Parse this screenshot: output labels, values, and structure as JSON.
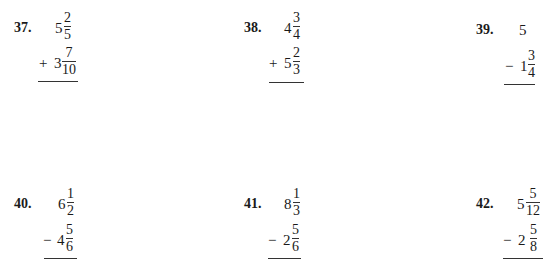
{
  "problems": [
    {
      "number": "37.",
      "top": {
        "whole": "5",
        "num": "2",
        "den": "5"
      },
      "operator": "+",
      "bottom": {
        "whole": "3",
        "num": "7",
        "den": "10"
      }
    },
    {
      "number": "38.",
      "top": {
        "whole": "4",
        "num": "3",
        "den": "4"
      },
      "operator": "+",
      "bottom": {
        "whole": "5",
        "num": "2",
        "den": "3"
      }
    },
    {
      "number": "39.",
      "top": {
        "whole": "5"
      },
      "operator": "−",
      "bottom": {
        "whole": "1",
        "num": "3",
        "den": "4"
      }
    },
    {
      "number": "40.",
      "top": {
        "whole": "6",
        "num": "1",
        "den": "2"
      },
      "operator": "−",
      "bottom": {
        "whole": "4",
        "num": "5",
        "den": "6"
      }
    },
    {
      "number": "41.",
      "top": {
        "whole": "8",
        "num": "1",
        "den": "3"
      },
      "operator": "−",
      "bottom": {
        "whole": "2",
        "num": "5",
        "den": "6"
      }
    },
    {
      "number": "42.",
      "top": {
        "whole": "5",
        "num": "5",
        "den": "12"
      },
      "operator": "−",
      "bottom": {
        "whole": "2",
        "num": "5",
        "den": "8"
      }
    }
  ]
}
